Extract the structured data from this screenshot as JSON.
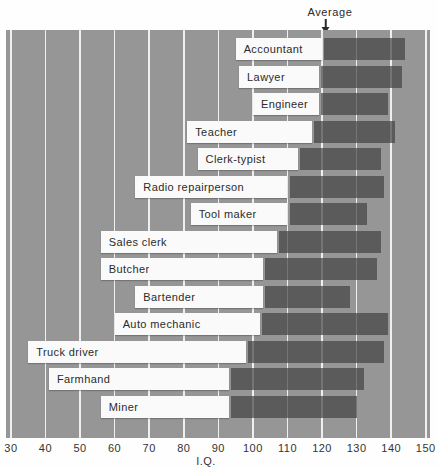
{
  "chart_data": {
    "type": "bar",
    "subtype": "horizontal-range-bars",
    "title": "",
    "xlabel": "I.Q.",
    "xlim": [
      30,
      150
    ],
    "x_ticks": [
      30,
      40,
      50,
      60,
      70,
      80,
      90,
      100,
      110,
      120,
      130,
      140,
      150
    ],
    "grid": "vertical-white-gridlines",
    "annotation": {
      "label": "Average",
      "points_at_iq": 121
    },
    "bar_encoding": {
      "white_segment": "from minimum IQ to average IQ",
      "dark_segment": "from average IQ to maximum IQ"
    },
    "series": [
      {
        "occupation": "Accountant",
        "min": 95,
        "avg": 120,
        "max": 144
      },
      {
        "occupation": "Lawyer",
        "min": 96,
        "avg": 119,
        "max": 143
      },
      {
        "occupation": "Engineer",
        "min": 100,
        "avg": 119,
        "max": 139
      },
      {
        "occupation": "Teacher",
        "min": 81,
        "avg": 117,
        "max": 141
      },
      {
        "occupation": "Clerk-typist",
        "min": 84,
        "avg": 113,
        "max": 137
      },
      {
        "occupation": "Radio repairperson",
        "min": 66,
        "avg": 110,
        "max": 138
      },
      {
        "occupation": "Tool maker",
        "min": 82,
        "avg": 110,
        "max": 133
      },
      {
        "occupation": "Sales clerk",
        "min": 56,
        "avg": 107,
        "max": 137
      },
      {
        "occupation": "Butcher",
        "min": 56,
        "avg": 103,
        "max": 136
      },
      {
        "occupation": "Bartender",
        "min": 66,
        "avg": 103,
        "max": 128
      },
      {
        "occupation": "Auto mechanic",
        "min": 60,
        "avg": 102,
        "max": 139
      },
      {
        "occupation": "Truck driver",
        "min": 35,
        "avg": 98,
        "max": 138
      },
      {
        "occupation": "Farmhand",
        "min": 41,
        "avg": 93,
        "max": 132
      },
      {
        "occupation": "Miner",
        "min": 56,
        "avg": 93,
        "max": 130
      }
    ]
  },
  "colors": {
    "plot_background": "#969696",
    "white_bar": "#fafafa",
    "dark_bar": "#616161",
    "gridline": "#ffffff",
    "text": "#2b2b2b",
    "page_background": "#fefefe"
  }
}
